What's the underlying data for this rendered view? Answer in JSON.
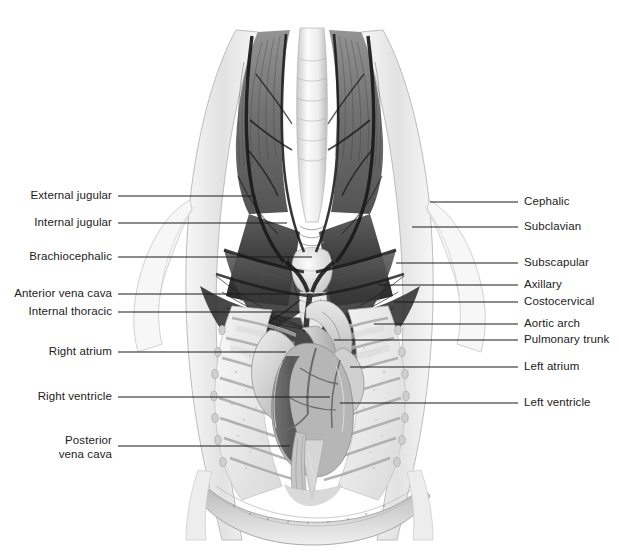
{
  "figure": {
    "style": "grayscale pencil illustration",
    "background_color": "#ffffff",
    "text_color": "#1c1c1c",
    "leader_line_color": "#1a1a1a"
  },
  "labels_left": [
    {
      "text": "External jugular",
      "text_x": 112,
      "text_y": 196,
      "line_x1": 118,
      "line_x2": 252,
      "line_y": 196
    },
    {
      "text": "Internal jugular",
      "text_x": 112,
      "text_y": 223,
      "line_x1": 118,
      "line_x2": 287,
      "line_y": 223
    },
    {
      "text": "Brachiocephalic",
      "text_x": 112,
      "text_y": 257,
      "line_x1": 118,
      "line_x2": 312,
      "line_y": 257
    },
    {
      "text": "Anterior vena cava",
      "text_x": 112,
      "text_y": 294,
      "line_x1": 118,
      "line_x2": 322,
      "line_y": 294
    },
    {
      "text": "Internal thoracic",
      "text_x": 112,
      "text_y": 312,
      "line_x1": 118,
      "line_x2": 300,
      "line_y": 312
    },
    {
      "text": "Right atrium",
      "text_x": 112,
      "text_y": 352,
      "line_x1": 118,
      "line_x2": 286,
      "line_y": 352
    },
    {
      "text": "Right ventricle",
      "text_x": 112,
      "text_y": 397,
      "line_x1": 118,
      "line_x2": 330,
      "line_y": 397
    }
  ],
  "labels_left_two_line": [
    {
      "line1": "Posterior",
      "line2": "vena cava",
      "text_x": 112,
      "text_y": 447,
      "line_x1": 118,
      "line_x2": 290,
      "line_y": 446
    }
  ],
  "labels_right": [
    {
      "text": "Cephalic",
      "text_x": 524,
      "text_y": 202,
      "line_x1": 430,
      "line_x2": 518,
      "line_y": 202
    },
    {
      "text": "Subclavian",
      "text_x": 524,
      "text_y": 227,
      "line_x1": 412,
      "line_x2": 518,
      "line_y": 227
    },
    {
      "text": "Subscapular",
      "text_x": 524,
      "text_y": 263,
      "line_x1": 396,
      "line_x2": 518,
      "line_y": 263
    },
    {
      "text": "Axillary",
      "text_x": 524,
      "text_y": 285,
      "line_x1": 378,
      "line_x2": 518,
      "line_y": 285
    },
    {
      "text": "Costocervical",
      "text_x": 524,
      "text_y": 302,
      "line_x1": 394,
      "line_x2": 518,
      "line_y": 302
    },
    {
      "text": "Aortic arch",
      "text_x": 524,
      "text_y": 324,
      "line_x1": 374,
      "line_x2": 518,
      "line_y": 324
    },
    {
      "text": "Pulmonary trunk",
      "text_x": 524,
      "text_y": 340,
      "line_x1": 334,
      "line_x2": 518,
      "line_y": 340
    },
    {
      "text": "Left atrium",
      "text_x": 524,
      "text_y": 367,
      "line_x1": 350,
      "line_x2": 518,
      "line_y": 367
    },
    {
      "text": "Left ventricle",
      "text_x": 524,
      "text_y": 403,
      "line_x1": 340,
      "line_x2": 518,
      "line_y": 403
    }
  ],
  "anatomy_regions": [
    "neck musculature",
    "trachea",
    "thyroid gland",
    "jugular veins",
    "thoracic inlet",
    "rib cage",
    "lungs",
    "heart",
    "diaphragm"
  ]
}
